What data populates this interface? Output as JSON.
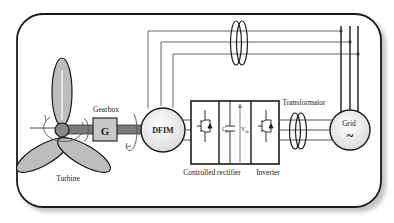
{
  "diagram": {
    "labels": {
      "turbine": "Turbine",
      "gearbox": "Gearbox",
      "gearbox_symbol": "G",
      "generator": "DFIM",
      "rectifier": "Controlled rectifier",
      "inverter": "Inverter",
      "transformer": "Transformator",
      "grid": "Grid",
      "grid_symbol": "~",
      "capacitor": "C",
      "capacitor_sub": "b",
      "dc_voltage": "V",
      "dc_voltage_sub": "dc"
    },
    "colors": {
      "frame": "#1a1a1a",
      "blade_fill": "#bdbdbd",
      "shaft": "#7a7a7a",
      "gearbox_fill": "#c8c8c8",
      "machine_fill": "#ececec",
      "wire": "#555555"
    }
  }
}
